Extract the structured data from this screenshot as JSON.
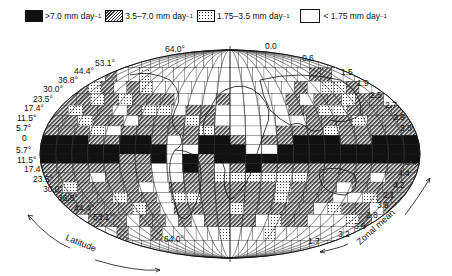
{
  "legend": [
    {
      "key": "black",
      "label": ">7.0 mm day",
      "sup": "−1"
    },
    {
      "key": "hatch",
      "label": "3.5–7.0 mm day",
      "sup": "−1"
    },
    {
      "key": "dots",
      "label": "1.75–3.5 mm day",
      "sup": "−1"
    },
    {
      "key": "white",
      "label": "< 1.75 mm day",
      "sup": "−1"
    }
  ],
  "latitude_labels_north": [
    "64.0°",
    "53.1°",
    "44.4°",
    "36.8°",
    "30.0°",
    "23.5°",
    "17.4°",
    "11.5°",
    "5.7°",
    "0"
  ],
  "latitude_labels_south": [
    "5.7°",
    "11.5°",
    "17.4°",
    "23.5°",
    "30.0°",
    "36.8°",
    "44.4°",
    "53.1°",
    "64.0°"
  ],
  "zonal_mean_north": [
    "0.0",
    "0.6",
    "1.5",
    "1.9",
    "2.5",
    "2.7",
    "2.9",
    "3.8",
    "3.6",
    "5.5",
    "6.4"
  ],
  "zonal_mean_south": [
    "4.4",
    "4.2",
    "2.1",
    "3.9",
    "2.8",
    "3.8",
    "3.2",
    "1.7"
  ],
  "axis_labels": {
    "latitude": "Latitude",
    "zonal_mean": "Zonal mean"
  },
  "colors": {
    "black": "#111111",
    "hatch": "#555555",
    "dots": "#dddddd",
    "white": "#ffffff"
  }
}
